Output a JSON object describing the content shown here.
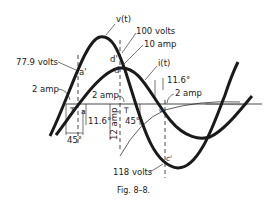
{
  "figure": {
    "caption": "Fig. 8–8.",
    "curves": {
      "voltage_label": "v(t)",
      "current_label": "i(t)"
    },
    "labels": {
      "v_peak": "100 volts",
      "i_peak": "10 amp",
      "v_a": "77.9 volts",
      "i_left": "2 amp",
      "i_mid": "2 amp",
      "i_right": "2 amp",
      "v_c": "118 volts",
      "angle_left_11": "11.6°",
      "angle_left_45": "45°",
      "amp_vertical": "12 amp",
      "angle_mid_45": "45°",
      "angle_right_11": "11.6°"
    },
    "points": {
      "a_prime": "a'",
      "a": "a",
      "d_prime": "d'",
      "d": "d",
      "c": "c",
      "c_prime": "c'"
    },
    "colors": {
      "ink": "#1a1a1a",
      "background": "#ffffff"
    }
  }
}
